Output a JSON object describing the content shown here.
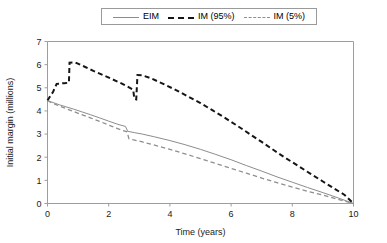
{
  "chart_data": {
    "type": "line",
    "title": "",
    "xlabel": "Time (years)",
    "ylabel": "Initial margin (millions)",
    "xlim": [
      0,
      10
    ],
    "ylim": [
      0,
      7
    ],
    "xticks": [
      "0",
      "2",
      "4",
      "6",
      "8",
      "10"
    ],
    "yticks": [
      "0",
      "1",
      "2",
      "3",
      "4",
      "5",
      "6",
      "7"
    ],
    "grid": false,
    "legend_position": "top-center",
    "series": [
      {
        "name": "EIM",
        "style": "solid",
        "color": "#8c8c8c",
        "points": [
          [
            0.0,
            4.45
          ],
          [
            0.1,
            4.4
          ],
          [
            0.25,
            4.33
          ],
          [
            0.4,
            4.26
          ],
          [
            0.6,
            4.18
          ],
          [
            0.85,
            4.08
          ],
          [
            1.1,
            3.97
          ],
          [
            1.4,
            3.84
          ],
          [
            1.7,
            3.7
          ],
          [
            2.0,
            3.56
          ],
          [
            2.3,
            3.42
          ],
          [
            2.55,
            3.33
          ],
          [
            2.62,
            3.12
          ],
          [
            2.85,
            3.06
          ],
          [
            3.1,
            3.0
          ],
          [
            3.5,
            2.88
          ],
          [
            4.0,
            2.72
          ],
          [
            4.5,
            2.54
          ],
          [
            5.0,
            2.34
          ],
          [
            5.5,
            2.12
          ],
          [
            6.0,
            1.89
          ],
          [
            6.5,
            1.64
          ],
          [
            7.0,
            1.4
          ],
          [
            7.5,
            1.15
          ],
          [
            8.0,
            0.92
          ],
          [
            8.5,
            0.69
          ],
          [
            9.0,
            0.47
          ],
          [
            9.5,
            0.24
          ],
          [
            10.0,
            0.0
          ]
        ]
      },
      {
        "name": "IM (95%)",
        "style": "dashed-bold",
        "color": "#151515",
        "points": [
          [
            0.0,
            4.45
          ],
          [
            0.08,
            4.62
          ],
          [
            0.18,
            4.82
          ],
          [
            0.3,
            5.17
          ],
          [
            0.55,
            5.2
          ],
          [
            0.7,
            5.22
          ],
          [
            0.72,
            6.08
          ],
          [
            0.9,
            6.1
          ],
          [
            1.2,
            5.92
          ],
          [
            1.5,
            5.73
          ],
          [
            1.8,
            5.56
          ],
          [
            2.1,
            5.38
          ],
          [
            2.4,
            5.2
          ],
          [
            2.65,
            5.03
          ],
          [
            2.8,
            4.92
          ],
          [
            2.84,
            4.52
          ],
          [
            2.9,
            4.5
          ],
          [
            2.94,
            5.55
          ],
          [
            3.1,
            5.54
          ],
          [
            3.4,
            5.4
          ],
          [
            3.8,
            5.16
          ],
          [
            4.2,
            4.9
          ],
          [
            4.6,
            4.62
          ],
          [
            5.0,
            4.34
          ],
          [
            5.4,
            4.02
          ],
          [
            5.8,
            3.7
          ],
          [
            6.2,
            3.36
          ],
          [
            6.6,
            3.01
          ],
          [
            7.0,
            2.66
          ],
          [
            7.4,
            2.3
          ],
          [
            7.8,
            1.95
          ],
          [
            8.2,
            1.62
          ],
          [
            8.6,
            1.28
          ],
          [
            9.0,
            0.95
          ],
          [
            9.4,
            0.62
          ],
          [
            9.7,
            0.38
          ],
          [
            10.0,
            0.0
          ]
        ]
      },
      {
        "name": "IM (5%)",
        "style": "dashed-thin",
        "color": "#8f8f8f",
        "points": [
          [
            0.0,
            4.45
          ],
          [
            0.12,
            4.36
          ],
          [
            0.3,
            4.26
          ],
          [
            0.55,
            4.13
          ],
          [
            0.8,
            4.0
          ],
          [
            1.1,
            3.85
          ],
          [
            1.4,
            3.7
          ],
          [
            1.7,
            3.55
          ],
          [
            2.0,
            3.39
          ],
          [
            2.25,
            3.26
          ],
          [
            2.45,
            3.16
          ],
          [
            2.6,
            3.1
          ],
          [
            2.66,
            2.8
          ],
          [
            2.85,
            2.74
          ],
          [
            3.1,
            2.66
          ],
          [
            3.5,
            2.52
          ],
          [
            4.0,
            2.34
          ],
          [
            4.5,
            2.14
          ],
          [
            5.0,
            1.94
          ],
          [
            5.5,
            1.73
          ],
          [
            6.0,
            1.52
          ],
          [
            6.5,
            1.31
          ],
          [
            7.0,
            1.1
          ],
          [
            7.5,
            0.9
          ],
          [
            8.0,
            0.71
          ],
          [
            8.5,
            0.53
          ],
          [
            9.0,
            0.36
          ],
          [
            9.5,
            0.18
          ],
          [
            10.0,
            0.0
          ]
        ]
      }
    ]
  },
  "legend": {
    "items": [
      {
        "label": "EIM",
        "swatch": "line-solid-icon"
      },
      {
        "label": "IM (95%)",
        "swatch": "line-dashed-bold-icon"
      },
      {
        "label": "IM (5%)",
        "swatch": "line-dashed-thin-icon"
      }
    ]
  }
}
